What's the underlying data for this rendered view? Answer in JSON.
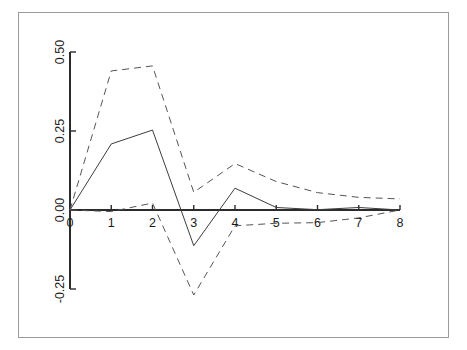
{
  "figure": {
    "name": "impulse-response-plot",
    "background_color": "#ffffff",
    "frame_color": "#9a9a9a"
  },
  "chart_data": {
    "type": "line",
    "title": "",
    "subtitle": "",
    "xlabel": "",
    "ylabel": "",
    "x": [
      0,
      1,
      2,
      3,
      4,
      5,
      6,
      7,
      8
    ],
    "xlim": [
      0,
      8
    ],
    "ylim": [
      -0.3,
      0.52
    ],
    "grid": false,
    "legend": "none",
    "x_ticks": [
      0,
      1,
      2,
      3,
      4,
      5,
      6,
      7,
      8
    ],
    "x_tick_labels": [
      "0",
      "1",
      "2",
      "3",
      "4",
      "5",
      "6",
      "7",
      "8"
    ],
    "y_ticks": [
      -0.25,
      0.0,
      0.25,
      0.5
    ],
    "y_tick_labels": [
      "-0.25",
      "0.00",
      "0.25",
      "0.50"
    ],
    "y_tick_label_rotation": -90,
    "series": [
      {
        "name": "impulse-response",
        "style": "solid",
        "color": "#3d3d3d",
        "width": 1,
        "values": [
          0.0,
          0.209,
          0.253,
          -0.113,
          0.069,
          0.008,
          0.001,
          0.008,
          0.0
        ]
      },
      {
        "name": "upper-confidence-band",
        "style": "dashed",
        "color": "#555555",
        "width": 1,
        "values": [
          0.0,
          0.44,
          0.456,
          0.056,
          0.147,
          0.09,
          0.055,
          0.04,
          0.035
        ]
      },
      {
        "name": "lower-confidence-band",
        "style": "dashed",
        "color": "#555555",
        "width": 1,
        "values": [
          0.0,
          -0.005,
          0.022,
          -0.269,
          -0.05,
          -0.042,
          -0.04,
          -0.025,
          0.0
        ]
      }
    ],
    "axis_color": "#2b2b2b"
  }
}
